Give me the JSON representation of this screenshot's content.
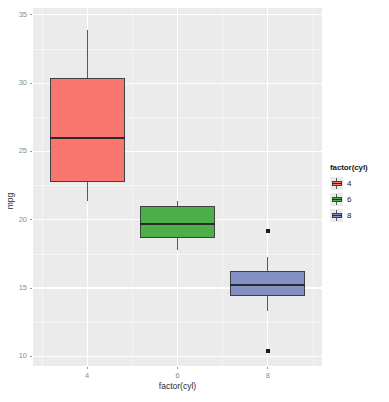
{
  "chart_data": {
    "type": "box",
    "title": "",
    "xlabel": "factor(cyl)",
    "ylabel": "mpg",
    "categories": [
      "4",
      "6",
      "8"
    ],
    "xlim": [
      0.4,
      3.6
    ],
    "ylim": [
      9.3,
      35.5
    ],
    "y_ticks": [
      35,
      30,
      25,
      20,
      15,
      10
    ],
    "y_tick_labels": [
      "35",
      "30",
      "25",
      "20",
      "15",
      "10"
    ],
    "y_minor_ticks": [
      32.5,
      27.5,
      22.5,
      17.5,
      12.5
    ],
    "x_tick_labels": [
      "4",
      "6",
      "8"
    ],
    "grid": true,
    "legend_position": "right",
    "legend_title": "factor(cyl)",
    "series": [
      {
        "name": "4",
        "category": "4",
        "fill": "#F8766D",
        "min": 21.4,
        "q1": 22.8,
        "median": 26.0,
        "q3": 30.4,
        "max": 33.9,
        "outliers": []
      },
      {
        "name": "6",
        "category": "6",
        "fill": "#4DAF4A",
        "min": 17.8,
        "q1": 18.65,
        "median": 19.7,
        "q3": 21.0,
        "max": 21.4,
        "outliers": []
      },
      {
        "name": "8",
        "category": "8",
        "fill": "#8390C4",
        "min": 13.3,
        "q1": 14.4,
        "median": 15.2,
        "q3": 16.25,
        "max": 17.3,
        "outliers": [
          19.2,
          10.4
        ]
      }
    ]
  },
  "axes": {
    "y_title": "mpg",
    "x_title": "factor(cyl)",
    "y_tick_labels": [
      "35",
      "30",
      "25",
      "20",
      "15",
      "10"
    ],
    "x_tick_labels": [
      "4",
      "6",
      "8"
    ]
  },
  "legend": {
    "title": "factor(cyl)",
    "items": [
      {
        "label": "4",
        "color": "#F8766D"
      },
      {
        "label": "6",
        "color": "#4DAF4A"
      },
      {
        "label": "8",
        "color": "#8390C4"
      }
    ]
  },
  "theme": {
    "panel_background": "#ebebeb",
    "grid_major": "#ffffff",
    "grid_minor": "#f5f5f5",
    "plot_background": "#ffffff",
    "tick_text": "#8c8c8c",
    "title_text": "#1a1a1a",
    "box_border": "#3f3f3f",
    "median_color": "#2b2b2b",
    "whisker_color": "#585858",
    "outlier_color": "#1a1a1a"
  }
}
